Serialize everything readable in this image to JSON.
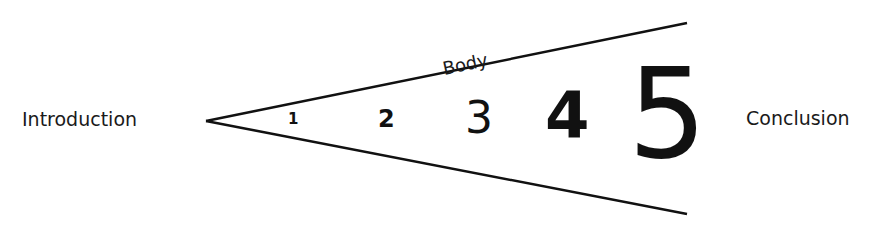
{
  "diagram": {
    "left_label": "Introduction",
    "right_label": "Conclusion",
    "wedge_label": "Body",
    "numbers": [
      "1",
      "2",
      "3",
      "4",
      "5"
    ],
    "line_color": "#111111"
  }
}
